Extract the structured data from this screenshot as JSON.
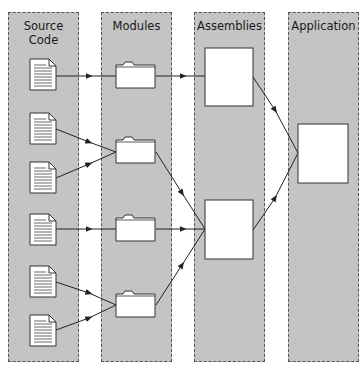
{
  "diagram": {
    "lanes": [
      {
        "id": "source",
        "label": "Source Code"
      },
      {
        "id": "modules",
        "label": "Modules"
      },
      {
        "id": "assemblies",
        "label": "Assemblies"
      },
      {
        "id": "application",
        "label": "Application"
      }
    ],
    "nodes": {
      "source_files": 6,
      "modules": 4,
      "assemblies": 2,
      "application": 1
    },
    "edges": [
      {
        "from": "source-1",
        "to": "module-1"
      },
      {
        "from": "source-2",
        "to": "module-2"
      },
      {
        "from": "source-3",
        "to": "module-2"
      },
      {
        "from": "source-4",
        "to": "module-3"
      },
      {
        "from": "source-5",
        "to": "module-4"
      },
      {
        "from": "source-6",
        "to": "module-4"
      },
      {
        "from": "module-1",
        "to": "assembly-1"
      },
      {
        "from": "module-2",
        "to": "assembly-2"
      },
      {
        "from": "module-3",
        "to": "assembly-2"
      },
      {
        "from": "module-4",
        "to": "assembly-2"
      },
      {
        "from": "assembly-1",
        "to": "application"
      },
      {
        "from": "assembly-2",
        "to": "application"
      }
    ],
    "colors": {
      "lane_fill": "#c4c4c4",
      "lane_border": "#555555",
      "node_fill": "#ffffff",
      "stroke": "#333333"
    }
  }
}
